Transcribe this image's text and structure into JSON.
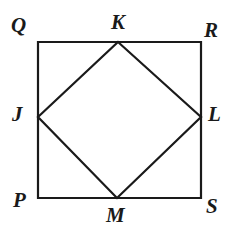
{
  "figure": {
    "background_color": "#ffffff",
    "stroke_color": "#1a1a1a",
    "stroke_width": 2,
    "label_color": "#1a1a1a",
    "outer_square": {
      "name": "PQRS",
      "corners": [
        {
          "id": "Q",
          "label": "Q",
          "role": "top-left",
          "x": 38,
          "y": 42
        },
        {
          "id": "R",
          "label": "R",
          "role": "top-right",
          "x": 201,
          "y": 42
        },
        {
          "id": "S",
          "label": "S",
          "role": "bottom-right",
          "x": 201,
          "y": 198
        },
        {
          "id": "P",
          "label": "P",
          "role": "bottom-left",
          "x": 38,
          "y": 198
        }
      ],
      "edges": [
        "QR",
        "RS",
        "SP",
        "PQ"
      ]
    },
    "inscribed_quadrilateral": {
      "name": "JKLM",
      "vertices": [
        {
          "id": "K",
          "label": "K",
          "role": "top-midpoint",
          "x": 118,
          "y": 42
        },
        {
          "id": "L",
          "label": "L",
          "role": "right-midpoint",
          "x": 201,
          "y": 117
        },
        {
          "id": "M",
          "label": "M",
          "role": "bottom-midpoint",
          "x": 117,
          "y": 198
        },
        {
          "id": "J",
          "label": "J",
          "role": "left-midpoint",
          "x": 38,
          "y": 117
        }
      ],
      "edges": [
        "JK",
        "KL",
        "LM",
        "MJ"
      ],
      "fill": "none"
    }
  },
  "chart_data": {
    "type": "diagram",
    "shapes": [
      {
        "kind": "square",
        "label": "PQRS",
        "points": [
          [
            38,
            42
          ],
          [
            201,
            42
          ],
          [
            201,
            198
          ],
          [
            38,
            198
          ]
        ],
        "closed": true,
        "fill": "none",
        "stroke": "#1a1a1a"
      },
      {
        "kind": "quadrilateral",
        "label": "JKLM",
        "points": [
          [
            118,
            42
          ],
          [
            201,
            117
          ],
          [
            117,
            198
          ],
          [
            38,
            117
          ]
        ],
        "closed": true,
        "fill": "none",
        "stroke": "#1a1a1a"
      }
    ],
    "point_labels": [
      {
        "text": "Q",
        "x": 38,
        "y": 42,
        "placement": "outside-top-left"
      },
      {
        "text": "K",
        "x": 118,
        "y": 42,
        "placement": "outside-above"
      },
      {
        "text": "R",
        "x": 201,
        "y": 42,
        "placement": "outside-top-right"
      },
      {
        "text": "J",
        "x": 38,
        "y": 117,
        "placement": "outside-left"
      },
      {
        "text": "L",
        "x": 201,
        "y": 117,
        "placement": "outside-right"
      },
      {
        "text": "P",
        "x": 38,
        "y": 198,
        "placement": "outside-bottom-left"
      },
      {
        "text": "M",
        "x": 117,
        "y": 198,
        "placement": "outside-below"
      },
      {
        "text": "S",
        "x": 201,
        "y": 198,
        "placement": "outside-bottom-right"
      }
    ],
    "xlim": [
      0,
      231
    ],
    "ylim": [
      238,
      0
    ],
    "grid": false,
    "legend": false,
    "axes_visible": false
  }
}
